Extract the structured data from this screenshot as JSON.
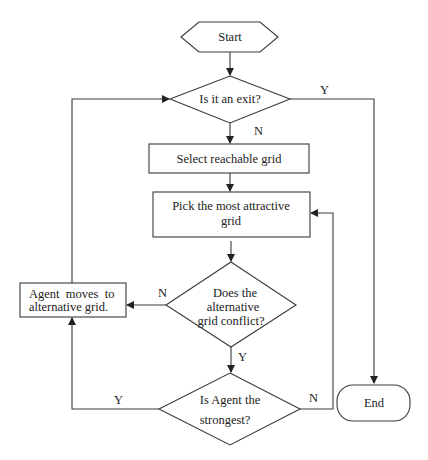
{
  "diagram": {
    "type": "flowchart",
    "nodes": {
      "start": {
        "label": "Start",
        "shape": "hexagon"
      },
      "exit_check": {
        "label": "Is it an exit?",
        "shape": "diamond"
      },
      "select": {
        "label": "Select reachable grid",
        "shape": "rectangle"
      },
      "pick": {
        "line1": "Pick the most attractive",
        "line2": "grid",
        "shape": "rectangle"
      },
      "conflict": {
        "line1": "Does the",
        "line2": "alternative",
        "line3": "grid conflict?",
        "shape": "diamond"
      },
      "move": {
        "line1": "Agent  moves  to",
        "line2": "alternative grid.",
        "shape": "rectangle"
      },
      "strongest": {
        "line1": "Is Agent the",
        "line2": "strongest?",
        "shape": "diamond"
      },
      "end": {
        "label": "End",
        "shape": "rounded-rectangle"
      }
    },
    "edges": {
      "exit_yes": "Y",
      "exit_no": "N",
      "conflict_no": "N",
      "conflict_yes": "Y",
      "strongest_yes": "Y",
      "strongest_no": "N"
    },
    "connections": [
      {
        "from": "start",
        "to": "exit_check"
      },
      {
        "from": "exit_check",
        "to": "end",
        "label": "Y"
      },
      {
        "from": "exit_check",
        "to": "select",
        "label": "N"
      },
      {
        "from": "select",
        "to": "pick"
      },
      {
        "from": "pick",
        "to": "conflict"
      },
      {
        "from": "conflict",
        "to": "move",
        "label": "N"
      },
      {
        "from": "conflict",
        "to": "strongest",
        "label": "Y"
      },
      {
        "from": "strongest",
        "to": "move",
        "label": "Y"
      },
      {
        "from": "strongest",
        "to": "pick",
        "label": "N"
      },
      {
        "from": "move",
        "to": "exit_check"
      }
    ]
  }
}
